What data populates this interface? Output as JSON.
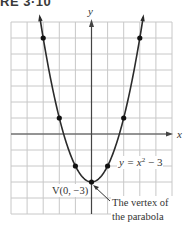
{
  "figure": {
    "title_visible": "RE 3·10"
  },
  "chart_data": {
    "type": "line",
    "title": "",
    "equation_label": "y = x² − 3",
    "xlabel": "x",
    "ylabel": "y",
    "xlim": [
      -5,
      5
    ],
    "ylim": [
      -5,
      7
    ],
    "grid": true,
    "grid_step": 1,
    "points": [
      {
        "x": -3,
        "y": 6
      },
      {
        "x": -2,
        "y": 1
      },
      {
        "x": -1,
        "y": -2
      },
      {
        "x": 0,
        "y": -3
      },
      {
        "x": 1,
        "y": -2
      },
      {
        "x": 2,
        "y": 1
      },
      {
        "x": 3,
        "y": 6
      }
    ],
    "vertex": {
      "x": 0,
      "y": -3,
      "label": "V(0, −3)"
    },
    "annotations": [
      {
        "text_line1": "The vertex of",
        "text_line2": "the parabola",
        "points_to": {
          "x": 0,
          "y": -3
        }
      }
    ]
  },
  "labels": {
    "x_axis": "x",
    "y_axis": "y",
    "equation": "y = x",
    "equation_exp": "2",
    "equation_tail": " − 3",
    "vertex": "V(0, −3)",
    "note_line1": "The vertex of",
    "note_line2": "the parabola"
  },
  "colors": {
    "grid": "#c8c8c8",
    "axis": "#444444",
    "curve": "#2b2b2b",
    "text": "#333333"
  }
}
